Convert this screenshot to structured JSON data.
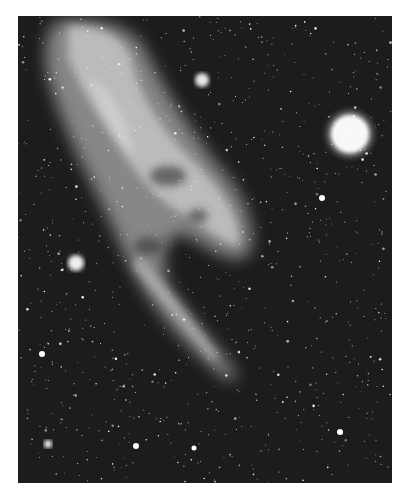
{
  "image": {
    "subject": "nebula-astrophotograph",
    "style": "black-and-white",
    "colors": {
      "background": "#ffffff",
      "sky": "#1c1c1c",
      "nebula": "#cfcfcf",
      "star": "#ffffff"
    },
    "bright_stars": [
      {
        "x": 350,
        "y": 134,
        "r": 22
      },
      {
        "x": 58,
        "y": 247,
        "r": 8
      },
      {
        "x": 184,
        "y": 64,
        "r": 7
      },
      {
        "x": 30,
        "y": 428,
        "r": 4
      },
      {
        "x": 322,
        "y": 416,
        "r": 3
      },
      {
        "x": 304,
        "y": 182,
        "r": 3
      },
      {
        "x": 24,
        "y": 338,
        "r": 3
      }
    ]
  }
}
